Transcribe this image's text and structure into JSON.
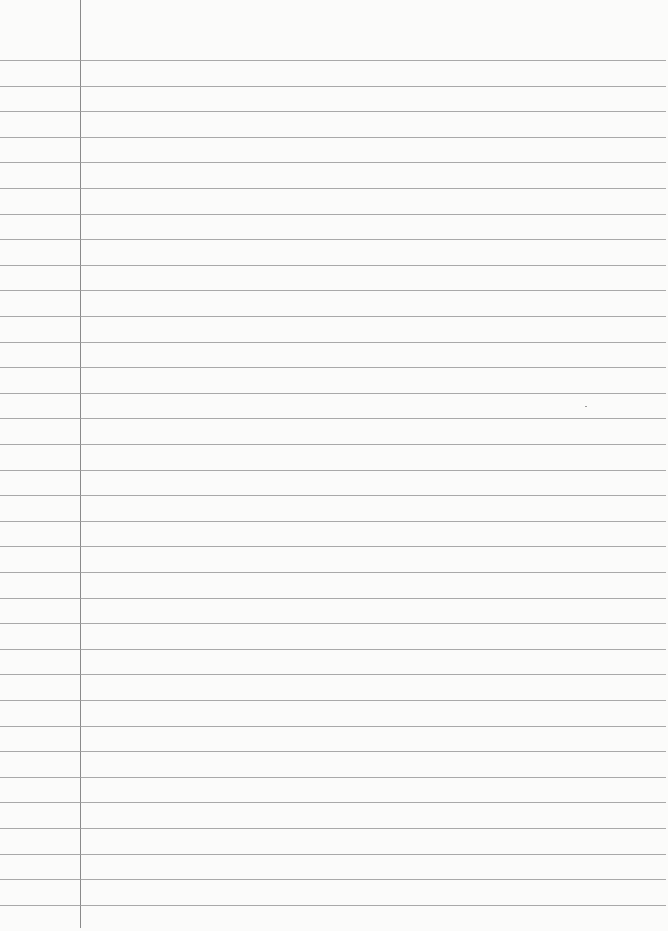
{
  "paper": {
    "type": "ruled-notebook-page",
    "background_color": "#fbfbfa",
    "rule_color": "#9a9a9a",
    "margin_line_color": "#8a8a8a",
    "margin_line_x": 80,
    "first_rule_y": 60,
    "rule_spacing": 25.6,
    "rule_count": 34,
    "content_text": ""
  }
}
